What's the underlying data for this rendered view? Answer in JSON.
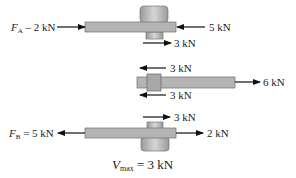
{
  "diagram": {
    "type": "free-body diagrams of bolted lap joint",
    "top": {
      "left_force": {
        "symbol": "F",
        "subscript": "A",
        "value": "– 2 kN"
      },
      "right_force": "5 kN",
      "shear_force": "3 kN"
    },
    "middle": {
      "shear_top": "3 kN",
      "shear_bottom": "3 kN",
      "right_force": "6 kN"
    },
    "bottom": {
      "shear_force": "3 kN",
      "left_force": {
        "symbol": "F",
        "subscript": "B",
        "value": "= 5 kN"
      },
      "right_force": "2 kN"
    },
    "result": {
      "symbol": "V",
      "subscript": "max",
      "value": "= 3 kN"
    }
  },
  "colors": {
    "bar": "#b4b4b4",
    "bar_edge": "#6e6e6e",
    "bolt": "#c8c8c8",
    "arrow": "#111111"
  }
}
